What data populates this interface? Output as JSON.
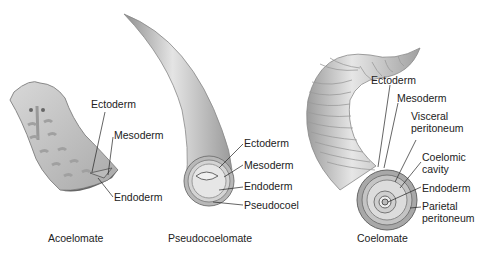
{
  "panels": [
    {
      "caption": "Acoelomate",
      "labels": [
        "Ectoderm",
        "Mesoderm",
        "Endoderm"
      ]
    },
    {
      "caption": "Pseudocoelomate",
      "labels": [
        "Ectoderm",
        "Mesoderm",
        "Endoderm",
        "Pseudocoel"
      ]
    },
    {
      "caption": "Coelomate",
      "labels": [
        "Ectoderm",
        "Mesoderm",
        "Visceral",
        "peritoneum",
        "Coelomic",
        "cavity",
        "Endoderm",
        "Parietal",
        "peritoneum"
      ]
    }
  ]
}
